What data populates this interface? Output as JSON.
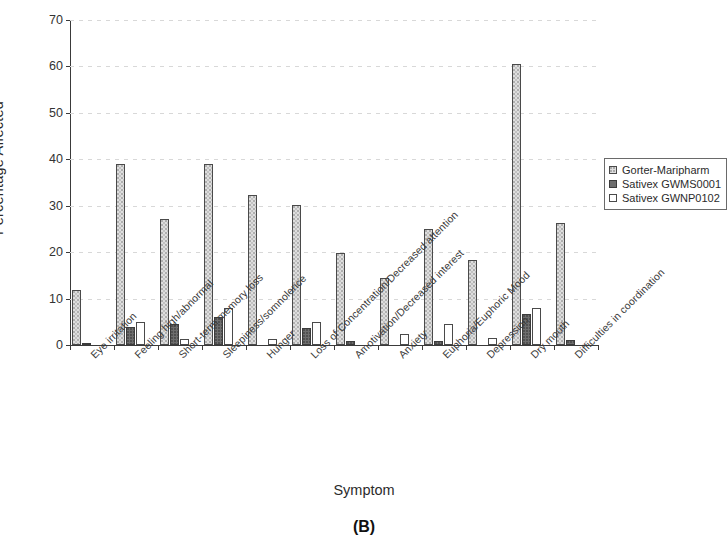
{
  "figure": {
    "panel_caption": "(B)",
    "xlabel": "Symptom",
    "ylabel": "Percentage Affected"
  },
  "legend": {
    "position": "right",
    "entries": [
      {
        "label": "Gorter-Maripharm",
        "color": "#dedede",
        "swatch": "light-gray-stipple"
      },
      {
        "label": "Sativex GWMS0001",
        "color": "#6e6e6e",
        "swatch": "dark-gray"
      },
      {
        "label": "Sativex GWNP0102",
        "color": "#ffffff",
        "swatch": "white-outline"
      }
    ]
  },
  "yaxis": {
    "ticks": [
      "0",
      "10",
      "20",
      "30",
      "40",
      "50",
      "60",
      "70"
    ],
    "min": 0,
    "max": 70,
    "step": 10
  },
  "chart_data": {
    "type": "bar",
    "title": "",
    "subtitle": "",
    "xlabel": "Symptom",
    "ylabel": "Percentage Affected",
    "ylim": [
      0,
      70
    ],
    "ytick_step": 10,
    "grid": true,
    "legend_position": "right",
    "categories": [
      "Eye irritation",
      "Feeling high/abnormal",
      "Short-term memory loss",
      "Sleepiness/somnolence",
      "Hunger",
      "Loss of Concentration/Decreased attention",
      "Amotivation/Decreased interest",
      "Anxiety",
      "Euphoria/Euphoric Mood",
      "Depression",
      "Dry mouth",
      "Difficulties in coordination"
    ],
    "series": [
      {
        "name": "Gorter-Maripharm",
        "color": "#dedede",
        "values": [
          11.8,
          38.9,
          27.2,
          38.9,
          32.4,
          30.2,
          19.8,
          14.5,
          25.0,
          18.4,
          60.5,
          26.2
        ]
      },
      {
        "name": "Sativex GWMS0001",
        "color": "#6e6e6e",
        "values": [
          0.3,
          3.8,
          4.5,
          6.0,
          0.0,
          3.6,
          0.9,
          0.0,
          0.8,
          0.0,
          6.6,
          1.0
        ]
      },
      {
        "name": "Sativex GWNP0102",
        "color": "#ffffff",
        "values": [
          0.0,
          5.0,
          1.4,
          8.0,
          1.2,
          5.0,
          0.0,
          2.4,
          4.5,
          1.6,
          8.0,
          0.0
        ]
      }
    ]
  }
}
